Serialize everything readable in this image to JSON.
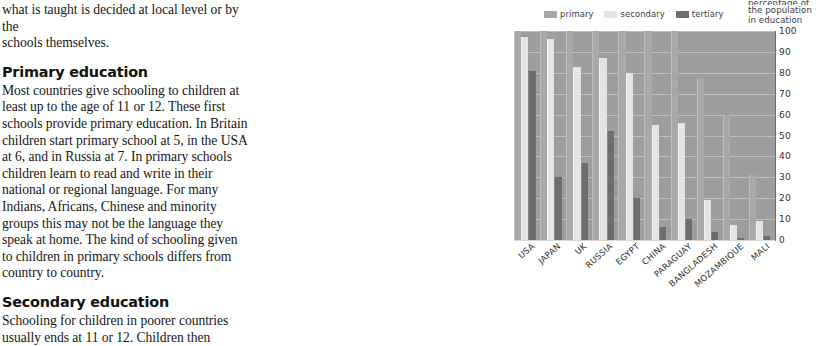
{
  "article": {
    "intro_lines": [
      "what is taught is decided at local level or by the",
      "schools themselves."
    ],
    "section1_heading": "Primary education",
    "section1_body": "Most countries give schooling to children at least up to the age of  11 or 12. These first schools provide primary education. In Britain children start primary school at 5, in the USA at 6, and in Russia at 7. In primary schools children learn to read and write in their national or regional language. For many Indians, Africans, Chinese and minority groups this may not be the language they speak at home. The kind of schooling given to children in primary schools differs from country to country.",
    "section2_heading": "Secondary education",
    "section2_body": "Schooling for children in poorer countries usually ends at 11 or 12. Children then"
  },
  "chart_data": {
    "type": "bar",
    "title": "",
    "axis_caption_lines": [
      "percentage of",
      "the population",
      "in education"
    ],
    "ylabel": "percentage of the population in education",
    "xlabel": "",
    "ylim": [
      0,
      100
    ],
    "yticks": [
      100,
      90,
      80,
      70,
      60,
      50,
      40,
      30,
      20,
      10,
      0
    ],
    "grid": true,
    "legend_position": "top",
    "categories": [
      "USA",
      "JAPAN",
      "UK",
      "RUSSIA",
      "EGYPT",
      "CHINA",
      "PARAGUAY",
      "BANGLADESH",
      "MOZAMBIQUE",
      "MALI"
    ],
    "series": [
      {
        "name": "primary",
        "color": "#a8a8a8",
        "values": [
          100,
          100,
          100,
          100,
          100,
          100,
          100,
          77,
          60,
          31
        ]
      },
      {
        "name": "secondary",
        "color": "#e4e4e2",
        "values": [
          97,
          96,
          83,
          87,
          80,
          55,
          56,
          19,
          7,
          9
        ]
      },
      {
        "name": "tertiary",
        "color": "#6e6e6e",
        "values": [
          81,
          30,
          37,
          52,
          20,
          6,
          10,
          4,
          1,
          2
        ]
      }
    ],
    "colors": {
      "plot_background": "#9d9d9d",
      "gridline": "#c9c9c9",
      "primary": "#a8a8a8",
      "secondary": "#e4e4e2",
      "tertiary": "#6e6e6e"
    }
  }
}
